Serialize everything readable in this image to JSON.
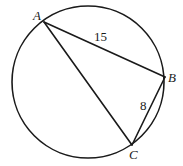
{
  "diagram": {
    "type": "inscribed-triangle-in-circle",
    "circle": {
      "cx": 88,
      "cy": 82,
      "r": 76
    },
    "points": {
      "A": {
        "label": "A",
        "x": 44,
        "y": 22
      },
      "B": {
        "label": "B",
        "x": 165,
        "y": 77
      },
      "C": {
        "label": "C",
        "x": 132,
        "y": 145
      }
    },
    "segments": [
      {
        "from": "A",
        "to": "B",
        "length_label": "15"
      },
      {
        "from": "B",
        "to": "C",
        "length_label": "8"
      },
      {
        "from": "A",
        "to": "C",
        "length_label": ""
      }
    ],
    "labels": {
      "A": "A",
      "B": "B",
      "C": "C",
      "AB": "15",
      "BC": "8"
    }
  }
}
